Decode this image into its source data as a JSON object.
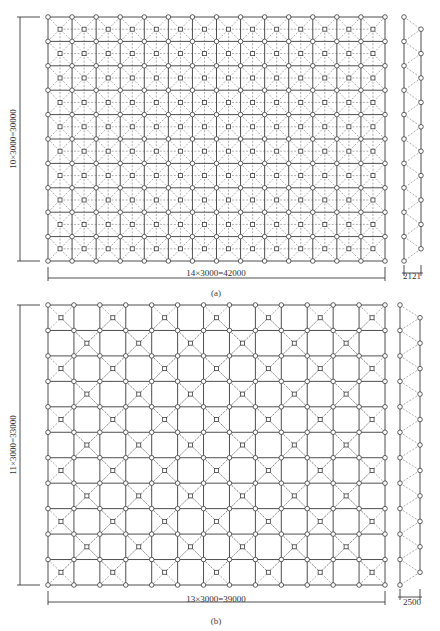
{
  "header": {
    "caption": ""
  },
  "figures": [
    {
      "id": "a",
      "label": "(a)",
      "plan": {
        "x0": 48,
        "y0": 17,
        "x1": 385,
        "y1": 261,
        "bays_x": 14,
        "bays_y": 10,
        "pattern": "full",
        "width_dim": "14×3000=42000",
        "height_dim": "10×3000=30000"
      },
      "side": {
        "x_top": 404,
        "x_bot": 421,
        "y0": 17,
        "y1": 261,
        "nodes": 11,
        "depth_dim": "2121"
      }
    },
    {
      "id": "b",
      "label": "(b)",
      "plan": {
        "x0": 48,
        "y0": 305,
        "x1": 385,
        "y1": 585,
        "bays_x": 13,
        "bays_y": 11,
        "pattern": "checker",
        "width_dim": "13×3000=39000",
        "height_dim": "11×3000=33000"
      },
      "side": {
        "x_top": 400,
        "x_bot": 420,
        "y0": 305,
        "y1": 585,
        "nodes": 12,
        "depth_dim": "2500"
      }
    }
  ],
  "colors": {
    "line": "#3a3a3a",
    "dashed": "#777777",
    "node_fill": "#ffffff"
  }
}
